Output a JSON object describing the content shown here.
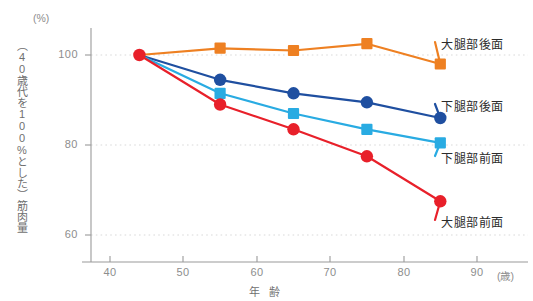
{
  "chart_data": {
    "type": "line",
    "title": "",
    "xlabel": "年 齢",
    "ylabel": "（40歳代を100%とした）筋肉量",
    "x_unit": "(歳)",
    "y_unit": "(%)",
    "x": [
      44,
      55,
      65,
      75,
      85
    ],
    "xlim": [
      36,
      94
    ],
    "ylim": [
      56,
      108
    ],
    "xticks": [
      40,
      50,
      60,
      70,
      80,
      90
    ],
    "yticks": [
      60,
      80,
      100
    ],
    "grid": "horizontal-dotted",
    "legend_position": "right-inline",
    "series": [
      {
        "name": "大腿部後面",
        "color": "#EE8022",
        "marker": "square",
        "values": [
          100,
          101.5,
          101,
          102.5,
          98
        ]
      },
      {
        "name": "下腿部後面",
        "color": "#1F4FA0",
        "marker": "circle",
        "values": [
          100,
          94.5,
          91.5,
          89.5,
          86
        ]
      },
      {
        "name": "下腿部前面",
        "color": "#29ABE2",
        "marker": "square",
        "values": [
          100,
          91.5,
          87,
          83.5,
          80.5
        ]
      },
      {
        "name": "大腿部前面",
        "color": "#E8202A",
        "marker": "circle",
        "values": [
          100,
          89,
          83.5,
          77.5,
          67.5
        ]
      }
    ]
  },
  "axis": {
    "y_unit_label": "(%)",
    "x_unit_label": "(歳)",
    "y_title": "（40歳代を100%とした）筋肉量",
    "x_title": "年 齢",
    "ytick_labels": [
      "100",
      "80",
      "60"
    ],
    "xtick_labels": [
      "40",
      "50",
      "60",
      "70",
      "80",
      "90"
    ]
  },
  "legend": {
    "items": [
      {
        "label": "大腿部後面",
        "color": "#EE8022"
      },
      {
        "label": "下腿部後面",
        "color": "#1F4FA0"
      },
      {
        "label": "下腿部前面",
        "color": "#29ABE2"
      },
      {
        "label": "大腿部前面",
        "color": "#E8202A"
      }
    ]
  }
}
